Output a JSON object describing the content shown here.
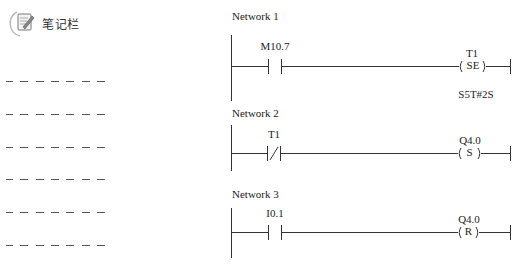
{
  "notes_panel": {
    "title": "笔记栏",
    "icon": "notepad-pen-icon",
    "dashed_lines": 6
  },
  "networks": [
    {
      "label": "Network 1",
      "contact": {
        "type": "normally-open",
        "address": "M10.7"
      },
      "coil": {
        "type": "SE",
        "text": "( SE )",
        "address": "T1",
        "parameter": "S5T#2S"
      }
    },
    {
      "label": "Network 2",
      "contact": {
        "type": "normally-closed",
        "address": "T1"
      },
      "coil": {
        "type": "S",
        "text": "( S )",
        "address": "Q4.0"
      }
    },
    {
      "label": "Network 3",
      "contact": {
        "type": "normally-open",
        "address": "I0.1"
      },
      "coil": {
        "type": "R",
        "text": "( R )",
        "address": "Q4.0"
      }
    }
  ],
  "colors": {
    "line": "#333333",
    "dash": "#555555",
    "text": "#222222"
  }
}
